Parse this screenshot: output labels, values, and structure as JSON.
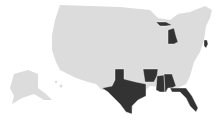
{
  "map": {
    "type": "choropleth",
    "region": "United States",
    "colors": {
      "highlighted": "#333333",
      "default": "#dcdcdc",
      "background": "#ffffff"
    },
    "highlighted_states": [
      "Michigan",
      "New Jersey",
      "Texas",
      "Arkansas",
      "Mississippi",
      "Alabama",
      "Florida"
    ]
  }
}
